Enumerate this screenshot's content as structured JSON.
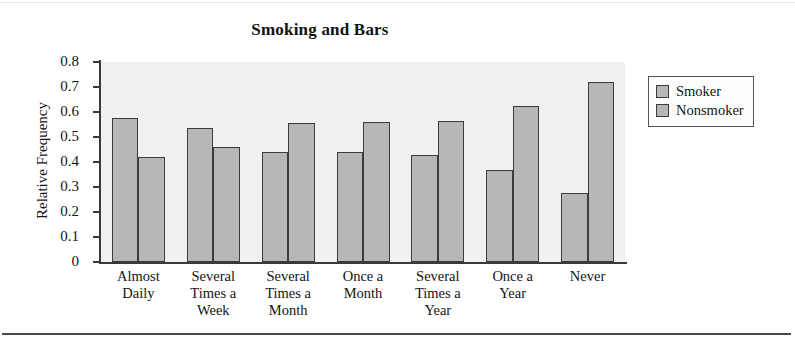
{
  "figure": {
    "title": "Smoking and Bars",
    "ylabel": "Relative Frequency",
    "bar_fill": "#b7b7b7",
    "bar_stroke": "#3c3c3c",
    "plot_bg": "#f1f1f1"
  },
  "legend": {
    "items": [
      {
        "label": "Smoker",
        "color": "#b7b7b7"
      },
      {
        "label": "Nonsmoker",
        "color": "#b7b7b7"
      }
    ]
  },
  "chart_data": {
    "type": "bar",
    "title": "Smoking and Bars",
    "xlabel": "",
    "ylabel": "Relative Frequency",
    "ylim": [
      0,
      0.8
    ],
    "yticks": [
      0,
      0.1,
      0.2,
      0.3,
      0.4,
      0.5,
      0.6,
      0.7,
      0.8
    ],
    "ytick_labels": [
      "0",
      "0.1",
      "0.2",
      "0.3",
      "0.4",
      "0.5",
      "0.6",
      "0.7",
      "0.8"
    ],
    "grid": false,
    "legend_position": "right",
    "categories": [
      "Almost Daily",
      "Several Times a Week",
      "Several Times a Month",
      "Once a Month",
      "Several Times a Year",
      "Once a Year",
      "Never"
    ],
    "category_lines": [
      [
        "Almost",
        "Daily"
      ],
      [
        "Several",
        "Times a",
        "Week"
      ],
      [
        "Several",
        "Times a",
        "Month"
      ],
      [
        "Once a",
        "Month"
      ],
      [
        "Several",
        "Times a",
        "Year"
      ],
      [
        "Once a",
        "Year"
      ],
      [
        "Never"
      ]
    ],
    "series": [
      {
        "name": "Smoker",
        "values": [
          0.575,
          0.535,
          0.44,
          0.44,
          0.43,
          0.37,
          0.275
        ]
      },
      {
        "name": "Nonsmoker",
        "values": [
          0.42,
          0.46,
          0.555,
          0.56,
          0.565,
          0.625,
          0.72
        ]
      }
    ]
  }
}
